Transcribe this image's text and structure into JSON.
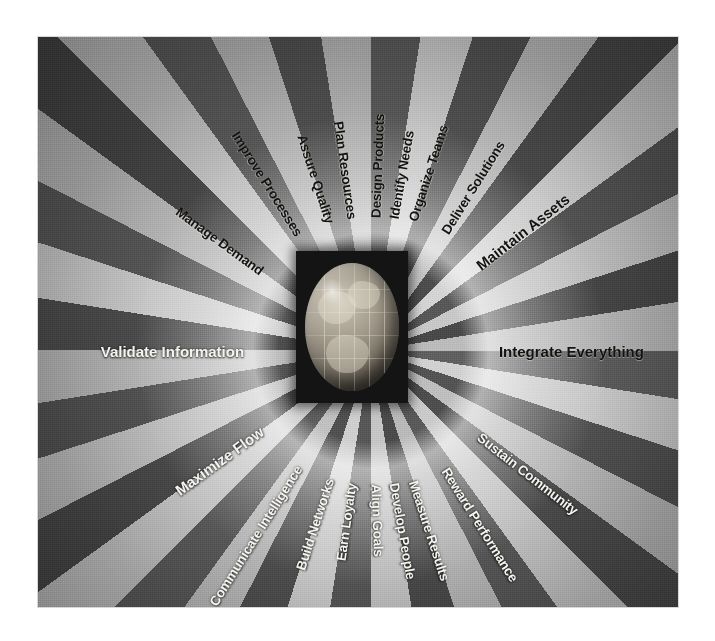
{
  "figure": {
    "type": "radial-sunburst-diagram",
    "center": {
      "object": "globe-sphere",
      "backdrop": "dark-square",
      "backdrop_color": "#141414",
      "globe_color": "#a79f90"
    },
    "palette": {
      "light_spoke": "#cfcfcf",
      "dark_spoke": "#545454",
      "page_background": "#ffffff",
      "dark_text": "#15130f",
      "light_text": "#f6f4ee"
    },
    "spoke_count": 20
  },
  "spokes": [
    {
      "label": "Deliver Solutions",
      "tone": "dark",
      "angle": -58,
      "radius": 268,
      "size": "normal"
    },
    {
      "label": "Organize Teams",
      "tone": "dark",
      "angle": -72,
      "radius": 262,
      "size": "normal"
    },
    {
      "label": "Identify Needs",
      "tone": "dark",
      "angle": -80,
      "radius": 258,
      "size": "normal"
    },
    {
      "label": "Design Products",
      "tone": "dark",
      "angle": -88,
      "radius": 256,
      "size": "normal"
    },
    {
      "label": "Plan Resources",
      "tone": "dark",
      "angle": -98,
      "radius": 256,
      "size": "normal"
    },
    {
      "label": "Assure Quality",
      "tone": "dark",
      "angle": -108,
      "radius": 258,
      "size": "normal"
    },
    {
      "label": "Improve Processes",
      "tone": "dark",
      "angle": -122,
      "radius": 262,
      "size": "normal"
    },
    {
      "label": "Manage Demand",
      "tone": "dark",
      "angle": -144,
      "radius": 258,
      "size": "normal"
    },
    {
      "label": "Validate Information",
      "tone": "light",
      "angle": -180,
      "radius": 244,
      "size": "big"
    },
    {
      "label": "Maximize Flow",
      "tone": "light",
      "angle": 144,
      "radius": 258,
      "size": "big"
    },
    {
      "label": "Communicate Intelligence",
      "tone": "light",
      "angle": 122,
      "radius": 262,
      "size": "normal"
    },
    {
      "label": "Build Networks",
      "tone": "light",
      "angle": 108,
      "radius": 258,
      "size": "normal"
    },
    {
      "label": "Earn Loyalty",
      "tone": "light",
      "angle": 98,
      "radius": 256,
      "size": "normal"
    },
    {
      "label": "Align Goals",
      "tone": "light",
      "angle": 88,
      "radius": 256,
      "size": "normal"
    },
    {
      "label": "Develop People",
      "tone": "light",
      "angle": 80,
      "radius": 258,
      "size": "normal"
    },
    {
      "label": "Measure Results",
      "tone": "light",
      "angle": 72,
      "radius": 262,
      "size": "normal"
    },
    {
      "label": "Reward Performance",
      "tone": "light",
      "angle": 58,
      "radius": 268,
      "size": "normal"
    },
    {
      "label": "Sustain Community",
      "tone": "light",
      "angle": 38,
      "radius": 264,
      "size": "normal"
    },
    {
      "label": "Integrate Everything",
      "tone": "dark",
      "angle": 0,
      "radius": 246,
      "size": "big"
    },
    {
      "label": "Maintain Assets",
      "tone": "dark",
      "angle": -38,
      "radius": 262,
      "size": "big"
    }
  ]
}
